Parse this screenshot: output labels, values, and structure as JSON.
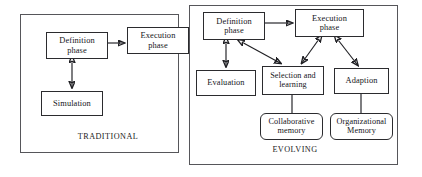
{
  "figure": {
    "background_color": "#ffffff",
    "line_color": "#1f1f23",
    "panel_border_color": "#56565a"
  },
  "panels": [
    {
      "id": "traditional",
      "caption": "TRADITIONAL",
      "nodes": [
        {
          "id": "definition",
          "label": "Definition\nphase",
          "shape": "rectangle"
        },
        {
          "id": "execution",
          "label": "Execution\nphase",
          "shape": "rectangle"
        },
        {
          "id": "simulation",
          "label": "Simulation",
          "shape": "rectangle"
        }
      ],
      "edges": [
        {
          "from": "definition",
          "to": "execution",
          "direction": "forward"
        },
        {
          "from": "definition",
          "to": "simulation",
          "direction": "both"
        }
      ]
    },
    {
      "id": "evolving",
      "caption": "EVOLVING",
      "nodes": [
        {
          "id": "definition",
          "label": "Definition\nphase",
          "shape": "rectangle"
        },
        {
          "id": "execution",
          "label": "Execution\nphase",
          "shape": "rectangle"
        },
        {
          "id": "evaluation",
          "label": "Evaluation",
          "shape": "rectangle"
        },
        {
          "id": "selection",
          "label": "Selection and\nlearning",
          "shape": "rectangle"
        },
        {
          "id": "adaption",
          "label": "Adaption",
          "shape": "rectangle"
        },
        {
          "id": "collaborative",
          "label": "Collaborative\nmemory",
          "shape": "rounded-rectangle"
        },
        {
          "id": "organizational",
          "label": "Organizational\nMemory",
          "shape": "rounded-rectangle"
        }
      ],
      "edges": [
        {
          "from": "definition",
          "to": "execution",
          "direction": "forward"
        },
        {
          "from": "definition",
          "to": "evaluation",
          "direction": "both"
        },
        {
          "from": "definition",
          "to": "selection",
          "direction": "both"
        },
        {
          "from": "execution",
          "to": "selection",
          "direction": "both"
        },
        {
          "from": "execution",
          "to": "adaption",
          "direction": "both"
        },
        {
          "from": "selection",
          "to": "collaborative",
          "direction": "none"
        },
        {
          "from": "adaption",
          "to": "organizational",
          "direction": "none"
        }
      ]
    }
  ]
}
